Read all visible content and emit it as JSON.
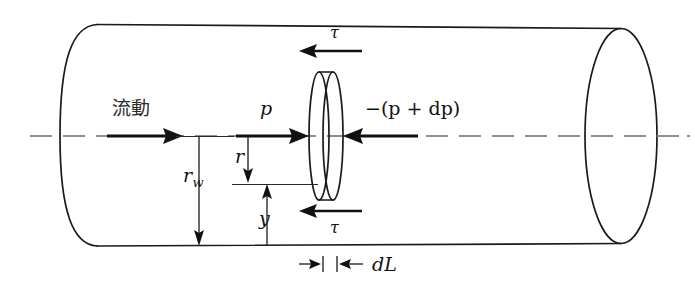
{
  "figure": {
    "type": "technical-diagram",
    "background_color": "#ffffff",
    "line_color": "#1a1a1a",
    "centerline_color": "#8e8e8e"
  },
  "labels": {
    "flow": "流動",
    "pressure_upstream": "p",
    "pressure_downstream": "−(p + dp)",
    "shear_top": "τ",
    "shear_bottom": "τ",
    "wall_radius": "r",
    "wall_radius_subscript": "w",
    "radius": "r",
    "wall_distance": "y",
    "length_element": "dL"
  },
  "geometry": {
    "pipe_left_x": 97,
    "pipe_right_x": 620,
    "pipe_top_y": 24,
    "pipe_bottom_y": 246,
    "centerline_y": 136,
    "element_center_x": 329,
    "element_half_width": 11,
    "element_ry": 64,
    "wall_radius_line_x": 199,
    "radius_line_x": 248,
    "radius_bottom_y": 184,
    "dL_label_y": 265
  },
  "annotations": [
    {
      "name": "flow-direction-arrow",
      "description": "thick arrow pointing right along centerline at pipe inlet"
    },
    {
      "name": "pressure-arrow-upstream",
      "description": "thick arrow pointing right toward element, labeled p"
    },
    {
      "name": "pressure-arrow-downstream",
      "description": "thick arrow pointing left toward element, labeled minus (p plus dp)"
    },
    {
      "name": "shear-arrow-top",
      "description": "thick arrow pointing left above element, labeled tau"
    },
    {
      "name": "shear-arrow-bottom",
      "description": "thick arrow pointing left below element, labeled tau"
    },
    {
      "name": "wall-radius-dimension",
      "description": "vertical dimension from centerline to pipe bottom wall, labeled r sub w"
    },
    {
      "name": "radius-dimension",
      "description": "vertical dimension from centerline down to element radius line, labeled r"
    },
    {
      "name": "wall-distance-dimension",
      "description": "vertical dimension from element radius line to pipe bottom wall, labeled y"
    },
    {
      "name": "dL-dimension",
      "description": "horizontal dimension arrows marking element thickness dL"
    }
  ]
}
